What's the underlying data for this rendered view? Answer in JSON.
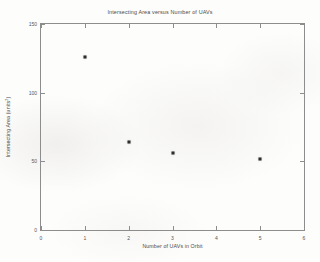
{
  "chart_data": {
    "type": "scatter",
    "title": "Intersecting Area versus Number of UAVs",
    "xlabel": "Number of UAVs in Orbit",
    "ylabel_prefix": "Intersecting Area (units",
    "ylabel_exponent": "2",
    "ylabel_suffix": ")",
    "xlim": [
      0,
      6
    ],
    "ylim": [
      0,
      150
    ],
    "xticks": [
      0,
      1,
      2,
      3,
      4,
      5,
      6
    ],
    "yticks": [
      0,
      50,
      100,
      150
    ],
    "xtick_labels": [
      "0",
      "1",
      "2",
      "3",
      "4",
      "5",
      "6"
    ],
    "ytick_labels": [
      "0",
      "50",
      "100",
      "150"
    ],
    "grid": false,
    "legend": null,
    "marker": "filled-square",
    "marker_color": "#2e2e2e",
    "axis_color": "#8d8d8d",
    "points": [
      {
        "x": 1,
        "y": 126
      },
      {
        "x": 2,
        "y": 64
      },
      {
        "x": 3,
        "y": 56
      },
      {
        "x": 5,
        "y": 52
      }
    ]
  }
}
